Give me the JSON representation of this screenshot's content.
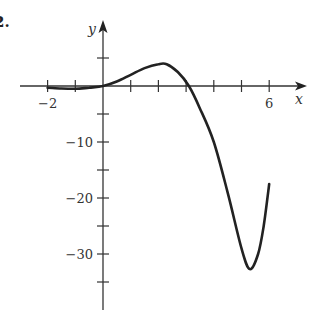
{
  "problem_number": "2.",
  "chart_data": {
    "type": "line",
    "title": "",
    "xlabel": "x",
    "ylabel": "y",
    "xlim": [
      -3,
      7.3
    ],
    "ylim": [
      -40,
      11.5
    ],
    "x_ticks": [
      -2,
      -1,
      0,
      1,
      2,
      3,
      4,
      5,
      6
    ],
    "x_tick_labels": [
      {
        "value": -2,
        "label": "−2"
      },
      {
        "value": 6,
        "label": "6"
      }
    ],
    "y_ticks": [
      5,
      -5,
      -10,
      -15,
      -20,
      -25,
      -30,
      -35
    ],
    "y_tick_labels": [
      {
        "value": -10,
        "label": "−10"
      },
      {
        "value": -20,
        "label": "−20"
      },
      {
        "value": -30,
        "label": "−30"
      }
    ],
    "grid": false,
    "legend": null,
    "series": [
      {
        "name": "curve",
        "x": [
          -2,
          -1.5,
          -1,
          -0.5,
          0,
          0.5,
          1,
          1.5,
          2,
          2.3,
          2.7,
          3.1,
          3.5,
          4,
          4.5,
          5,
          5.3,
          5.6,
          5.8,
          6
        ],
        "y": [
          -0.3,
          -0.45,
          -0.5,
          -0.3,
          0,
          0.8,
          2,
          3.2,
          3.9,
          3.9,
          2.5,
          0,
          -4,
          -10,
          -19,
          -29,
          -32.7,
          -30,
          -25,
          -17.5
        ]
      }
    ]
  }
}
